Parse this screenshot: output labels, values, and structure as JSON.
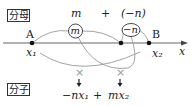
{
  "labels": {
    "denominator": "分母",
    "numerator": "分子"
  },
  "top": {
    "m": "m",
    "plus": "+",
    "neg_n": "(−n)"
  },
  "circles": {
    "m": "m",
    "neg_n": "−n"
  },
  "points": {
    "A": "A",
    "B": "B",
    "x1": "x₁",
    "x2": "x₂",
    "axis": "x"
  },
  "cross_marks": [
    "×",
    "×"
  ],
  "result": {
    "term1": "−nx₁",
    "plus": "+",
    "term2": "mx₂"
  },
  "colors": {
    "line": "#555555",
    "curve": "#999999",
    "dot": "#111111"
  }
}
